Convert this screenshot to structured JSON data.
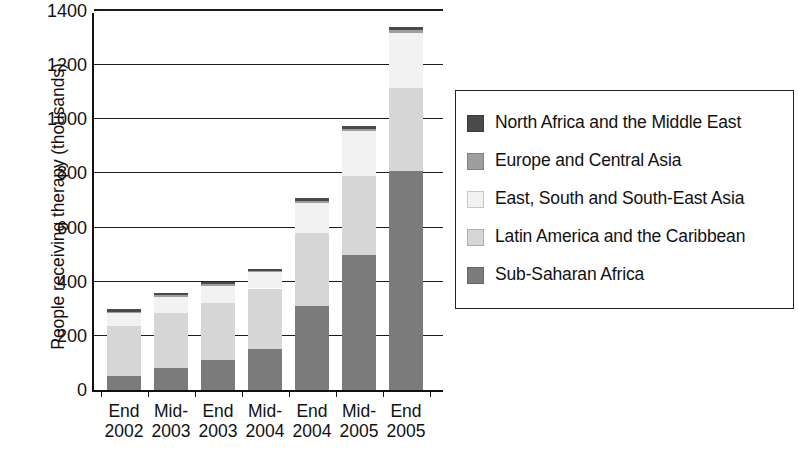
{
  "chart_data": {
    "type": "bar",
    "subtype": "stacked-vertical",
    "title": "",
    "xlabel": "",
    "ylabel": "People receiving therapy (thousands)",
    "ylim": [
      0,
      1400
    ],
    "yticks": [
      0,
      200,
      400,
      600,
      800,
      1000,
      1200,
      1400
    ],
    "ytick_labels": [
      "0",
      "200",
      "400",
      "600",
      "800",
      "1000",
      "1200",
      "1400"
    ],
    "grid": true,
    "grid_axis": "y",
    "legend_position": "right",
    "categories": [
      "End 2002",
      "Mid- 2003",
      "End 2003",
      "Mid- 2004",
      "End 2004",
      "Mid- 2005",
      "End 2005"
    ],
    "category_lines": [
      [
        "End",
        "2002"
      ],
      [
        "Mid-",
        "2003"
      ],
      [
        "End",
        "2003"
      ],
      [
        "Mid-",
        "2004"
      ],
      [
        "End",
        "2004"
      ],
      [
        "Mid-",
        "2005"
      ],
      [
        "End",
        "2005"
      ]
    ],
    "series": [
      {
        "name": "Sub-Saharan Africa",
        "color": "#7b7b7b",
        "values": [
          50,
          80,
          110,
          150,
          310,
          500,
          810
        ]
      },
      {
        "name": "Latin America and the Caribbean",
        "color": "#d6d6d6",
        "values": [
          185,
          205,
          210,
          225,
          270,
          290,
          305
        ]
      },
      {
        "name": "East, South and South-East Asia",
        "color": "#f2f2f2",
        "values": [
          50,
          60,
          65,
          60,
          110,
          165,
          205
        ]
      },
      {
        "name": "Europe and Central Asia",
        "color": "#9e9e9e",
        "values": [
          5,
          5,
          5,
          5,
          10,
          10,
          10
        ]
      },
      {
        "name": "North Africa and the Middle East",
        "color": "#4a4a4a",
        "values": [
          8,
          8,
          8,
          8,
          10,
          10,
          10
        ]
      }
    ],
    "totals": [
      298,
      358,
      398,
      448,
      710,
      975,
      1340
    ]
  },
  "legend": {
    "items": [
      {
        "label": "North Africa and the Middle East",
        "color": "#4a4a4a"
      },
      {
        "label": "Europe and Central Asia",
        "color": "#9e9e9e"
      },
      {
        "label": "East, South and South-East Asia",
        "color": "#f2f2f2"
      },
      {
        "label": "Latin America and the Caribbean",
        "color": "#d6d6d6"
      },
      {
        "label": "Sub-Saharan Africa",
        "color": "#7b7b7b"
      }
    ]
  },
  "colors": {
    "axis": "#111111",
    "background": "#ffffff",
    "text": "#111111"
  }
}
